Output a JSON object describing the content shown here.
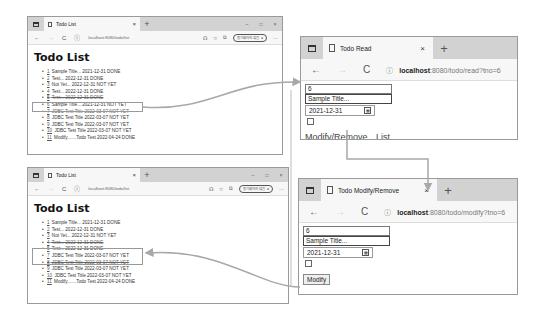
{
  "list_window_top": {
    "tab_title": "Todo List",
    "url": "localhost:8080/todo/list",
    "pill_label": "동기화하지 않음",
    "heading": "Todo List",
    "items": [
      {
        "tno": "1",
        "text": "Sample Title... 2021-12-31 DONE"
      },
      {
        "tno": "2",
        "text": "Test... 2022-12-31 DONE"
      },
      {
        "tno": "3",
        "text": "Not Yet... 2022-12-31 NOT YET"
      },
      {
        "tno": "4",
        "text": "Test... 2022-12-31 DONE"
      },
      {
        "tno": "5",
        "text": "Test... 2022-12-31 DONE"
      },
      {
        "tno": "6",
        "text": "Sample Title... 2021-12-31 NOT YET"
      },
      {
        "tno": "7",
        "text": "JDBC Test Title 2022-03-07 NOT YET"
      },
      {
        "tno": "8",
        "text": "JDBC Test Title 2022-03-07 NOT YET"
      },
      {
        "tno": "9",
        "text": "JDBC Test Title 2022-03-07 NOT YET"
      },
      {
        "tno": "10",
        "text": "JDBC Test Title 2022-03-07 NOT YET"
      },
      {
        "tno": "11",
        "text": "Modify.......Todo Test 2022-04-24 DONE"
      }
    ]
  },
  "list_window_bottom": {
    "tab_title": "Todo List",
    "url": "localhost:8080/todo/list",
    "pill_label": "동기화하지 않음",
    "heading": "Todo List",
    "items": [
      {
        "tno": "1",
        "text": "Sample Title... 2021-12-31 DONE"
      },
      {
        "tno": "2",
        "text": "Test... 2022-12-31 DONE"
      },
      {
        "tno": "3",
        "text": "Not Yet... 2022-12-31 NOT YET"
      },
      {
        "tno": "4",
        "text": "Test... 2022-12-31 DONE"
      },
      {
        "tno": "5",
        "text": "Test... 2022-12-31 DONE"
      },
      {
        "tno": "7",
        "text": "JDBC Test Title 2022-03-07 NOT YET"
      },
      {
        "tno": "8",
        "text": "JDBC Test Title 2022-03-07 NOT YET"
      },
      {
        "tno": "9",
        "text": "JDBC Test Title 2022-03-07 NOT YET"
      },
      {
        "tno": "10",
        "text": "JDBC Test Title 2022-03-07 NOT YET"
      },
      {
        "tno": "11",
        "text": "Modify.......Todo Test 2022-04-24 DONE"
      }
    ]
  },
  "read_window": {
    "tab_title": "Todo Read",
    "url_host": "localhost",
    "url_rest": ":8080/todo/read?tno=6",
    "tno": "6",
    "title": "Sample Title...",
    "due_date": "2021-12-31",
    "link_modify": "Modify/Remove",
    "link_list": "List"
  },
  "modify_window": {
    "tab_title": "Todo Modify/Remove",
    "url_host": "localhost",
    "url_rest": ":8080/todo/modify?tno=6",
    "tno": "6",
    "title": "Sample Title...",
    "due_date": "2021-12-31",
    "modify_button": "Modify",
    "remove_button": "Remove"
  },
  "icons": {
    "back": "←",
    "forward": "→",
    "reload": "C",
    "info": "ⓘ",
    "close": "×",
    "plus": "+",
    "minimize": "–",
    "maximize": "□",
    "window_close": "×",
    "more": "···",
    "calendar": "▦"
  },
  "colors": {
    "tabbar": "#d2d2d2",
    "highlight_border": "#999999",
    "arrow": "#a8a8a8"
  }
}
